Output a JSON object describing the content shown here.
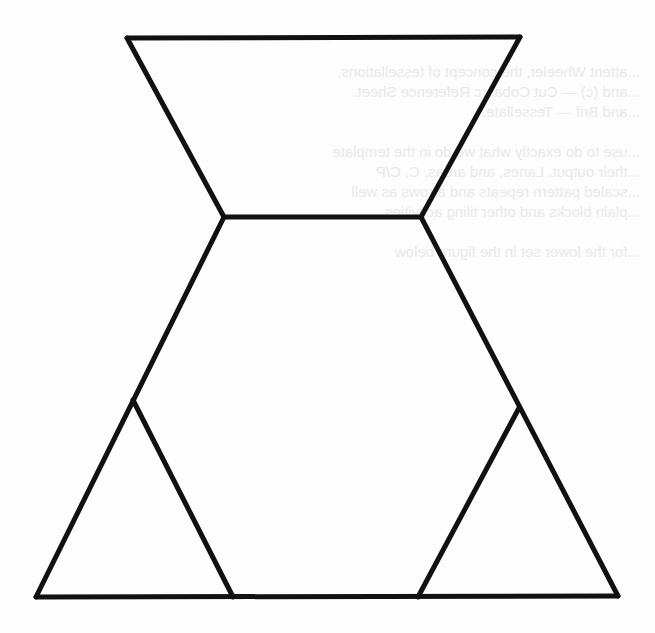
{
  "figure": {
    "stroke_color": "#111111",
    "stroke_width": 5,
    "background": "#fdfdfd",
    "vertices": {
      "top_left": [
        127,
        38
      ],
      "top_right": [
        520,
        37
      ],
      "waist_left": [
        224,
        217
      ],
      "waist_right": [
        421,
        217
      ],
      "bottom_left": [
        36,
        597
      ],
      "bottom_right": [
        618,
        596
      ],
      "left_inner_apex": [
        133,
        400
      ],
      "left_inner_base": [
        233,
        597
      ],
      "right_inner_apex": [
        519,
        408
      ],
      "right_inner_base": [
        418,
        597
      ]
    },
    "segments": [
      {
        "name": "top-edge",
        "from": "top_left",
        "to": "top_right"
      },
      {
        "name": "upper-left-edge",
        "from": "top_left",
        "to": "waist_left"
      },
      {
        "name": "upper-right-edge",
        "from": "top_right",
        "to": "waist_right"
      },
      {
        "name": "waist-edge",
        "from": "waist_left",
        "to": "waist_right"
      },
      {
        "name": "lower-left-edge",
        "from": "waist_left",
        "to": "bottom_left"
      },
      {
        "name": "lower-right-edge",
        "from": "waist_right",
        "to": "bottom_right"
      },
      {
        "name": "bottom-edge",
        "from": "bottom_left",
        "to": "bottom_right"
      },
      {
        "name": "left-inner-edge",
        "from": "left_inner_apex",
        "to": "left_inner_base"
      },
      {
        "name": "right-inner-edge",
        "from": "right_inner_apex",
        "to": "right_inner_base"
      }
    ]
  },
  "show_through_text": {
    "lines": [
      {
        "y": 70,
        "text": "...attent Wheeler, the concept of tessellations,"
      },
      {
        "y": 90,
        "text": "...and (c) — Cut Cobasrc Reference Sheet."
      },
      {
        "y": 110,
        "text": "...and Brif — Tessellate."
      },
      {
        "y": 150,
        "text": "...use to do exactly what we do in the template"
      },
      {
        "y": 170,
        "text": "...their output. Lanes, and areas, C, C/P"
      },
      {
        "y": 190,
        "text": "...scaled pattern repeats and a rows as well"
      },
      {
        "y": 210,
        "text": "...plain blocks and other tiling activities"
      },
      {
        "y": 250,
        "text": "...for the lower set in the figure below"
      }
    ]
  }
}
